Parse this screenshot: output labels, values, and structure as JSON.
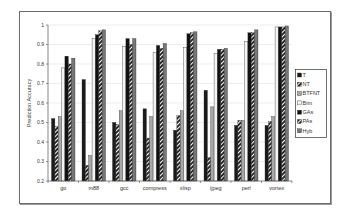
{
  "chart_data": {
    "type": "bar",
    "title": "",
    "xlabel": "",
    "ylabel": "Prediction Accuracy",
    "ylim": [
      0.2,
      1.0
    ],
    "yticks": [
      0.2,
      0.3,
      0.4,
      0.5,
      0.6,
      0.7,
      0.8,
      0.9,
      1.0
    ],
    "yticklabels": [
      "0.2",
      "0.3",
      "0.4",
      "0.5",
      "0.6",
      "0.7",
      "0.8",
      "0.9",
      "1"
    ],
    "grid": true,
    "legend_position": "right",
    "categories": [
      "go",
      "m88",
      "gcc",
      "compress",
      "xlisp",
      "ijpeg",
      "perl",
      "vortex"
    ],
    "series": [
      {
        "name": "T",
        "values": [
          0.52,
          0.72,
          0.5,
          0.57,
          0.46,
          0.665,
          0.485,
          0.485
        ]
      },
      {
        "name": "NT",
        "values": [
          0.48,
          0.28,
          0.49,
          0.42,
          0.535,
          0.32,
          0.51,
          0.505
        ]
      },
      {
        "name": "BTFNT",
        "values": [
          0.53,
          0.33,
          0.56,
          0.53,
          0.56,
          0.58,
          0.51,
          0.53
        ]
      },
      {
        "name": "Bim",
        "values": [
          0.78,
          0.93,
          0.89,
          0.86,
          0.885,
          0.855,
          0.915,
          0.99
        ]
      },
      {
        "name": "GAs",
        "values": [
          0.84,
          0.95,
          0.93,
          0.895,
          0.955,
          0.875,
          0.96,
          0.99
        ]
      },
      {
        "name": "PAs",
        "values": [
          0.8,
          0.97,
          0.9,
          0.88,
          0.96,
          0.875,
          0.96,
          0.99
        ]
      },
      {
        "name": "Hyb",
        "values": [
          0.83,
          0.975,
          0.93,
          0.905,
          0.965,
          0.88,
          0.975,
          0.995
        ]
      }
    ]
  },
  "styles": {
    "T": {
      "fill": "#1a1a1a",
      "pattern": "solid"
    },
    "NT": {
      "fill": "#222222",
      "pattern": "hatch"
    },
    "BTFNT": {
      "fill": "#a8a8a8",
      "pattern": "solid"
    },
    "Bim": {
      "fill": "#f4f4f4",
      "pattern": "solid"
    },
    "GAs": {
      "fill": "#111111",
      "pattern": "solid"
    },
    "PAs": {
      "fill": "#2a2a2a",
      "pattern": "hatch"
    },
    "Hyb": {
      "fill": "#777777",
      "pattern": "solid"
    }
  }
}
